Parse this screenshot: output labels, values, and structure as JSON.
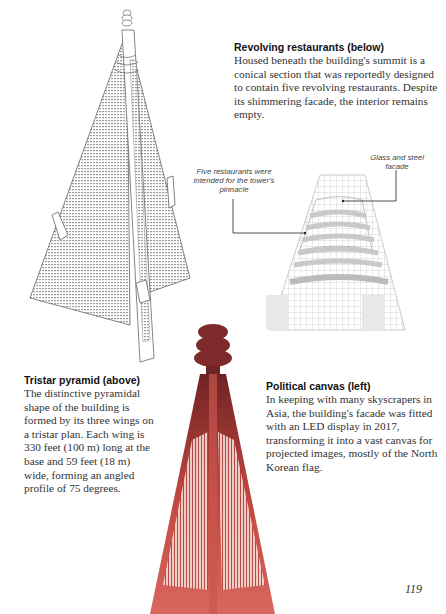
{
  "sections": {
    "revolving": {
      "heading": "Revolving restaurants (below)",
      "body": "Housed beneath the building's summit is a conical section that was reportedly designed to contain five revolving restaurants. Despite its shimmering facade, the interior remains empty."
    },
    "tristar": {
      "heading": "Tristar pyramid (above)",
      "body": "The distinctive pyramidal shape of the building is formed by its three wings on a tristar plan. Each wing is 330 feet (100 m) long at the base and 59 feet (18 m) wide, forming an angled profile of 75 degrees."
    },
    "political": {
      "heading": "Political canvas (left)",
      "body": "In keeping with many skyscrapers in Asia, the building's facade was fitted with an LED display in 2017, transforming it into a vast canvas for projected images, mostly of the North Korean flag."
    }
  },
  "callouts": {
    "restaurants": "Five restaurants were intended for the tower's pinnacle",
    "facade": "Glass and steel facade"
  },
  "illustrations": {
    "pyramid": "tristar-pyramid-illustration",
    "cone": "conical-section-illustration",
    "led_tower": "led-facade-tower-illustration"
  },
  "colors": {
    "led_red": "#c4473f",
    "led_dark": "#7e2a2a",
    "cone_band": "#c9c9c9"
  },
  "page_number": "119"
}
